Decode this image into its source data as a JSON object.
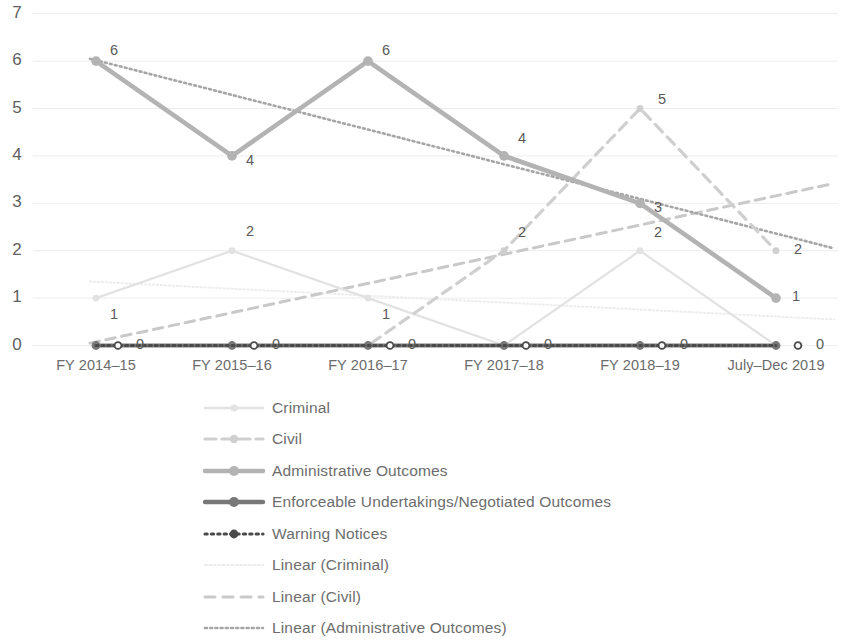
{
  "chart_data": {
    "type": "line",
    "title": "",
    "xlabel": "",
    "ylabel": "",
    "ylim": [
      0,
      7
    ],
    "yticks": [
      0,
      1,
      2,
      3,
      4,
      5,
      6,
      7
    ],
    "grid": true,
    "legend_position": "bottom",
    "categories": [
      "FY 2014–15",
      "FY 2015–16",
      "FY 2016–17",
      "FY 2017–18",
      "FY 2018–19",
      "July–Dec 2019"
    ],
    "series": [
      {
        "name": "Criminal",
        "values": [
          1,
          2,
          1,
          0,
          2,
          0
        ],
        "color": "#e2e2e2",
        "style": "solid",
        "width": 2.2,
        "marker": "circle",
        "labels": [
          "1",
          "2",
          "1",
          "",
          "2",
          ""
        ]
      },
      {
        "name": "Civil",
        "values": [
          0,
          0,
          0,
          2,
          5,
          2
        ],
        "color": "#cfcfcf",
        "style": "dashed",
        "width": 3.2,
        "marker": "circle",
        "labels": [
          "",
          "",
          "",
          "2",
          "5",
          "2"
        ]
      },
      {
        "name": "Administrative Outcomes",
        "values": [
          6,
          4,
          6,
          4,
          3,
          1
        ],
        "color": "#b3b3b3",
        "style": "solid",
        "width": 4.6,
        "marker": "circle",
        "labels": [
          "6",
          "4",
          "6",
          "4",
          "3",
          "1"
        ]
      },
      {
        "name": "Enforceable Undertakings/Negotiated Outcomes",
        "values": [
          0,
          0,
          0,
          0,
          0,
          0
        ],
        "color": "#787878",
        "style": "solid",
        "width": 4.2,
        "marker": "circle",
        "labels": [
          "",
          "",
          "",
          "",
          "",
          "0"
        ]
      },
      {
        "name": "Warning Notices",
        "values": [
          0,
          0,
          0,
          0,
          0,
          0
        ],
        "color": "#4a4a4a",
        "style": "dotted",
        "width": 3.0,
        "marker": "circle-open",
        "labels": [
          "",
          "",
          "",
          "",
          "",
          ""
        ]
      }
    ],
    "trendlines": [
      {
        "name": "Linear (Criminal)",
        "color": "#ededed",
        "style": "dotted",
        "width": 2.0,
        "start_value": 1.35,
        "end_value": 0.55
      },
      {
        "name": "Linear (Civil)",
        "color": "#c9c9c9",
        "style": "dashed",
        "width": 3.0,
        "start_value": 0.05,
        "end_value": 3.42
      },
      {
        "name": "Linear (Administrative Outcomes)",
        "color": "#a6a6a6",
        "style": "dotted",
        "width": 2.6,
        "start_value": 6.05,
        "end_value": 2.05
      }
    ],
    "zero_line_labels": [
      "0",
      "0",
      "0",
      "0",
      "0",
      "0"
    ]
  },
  "legend": {
    "items": [
      {
        "label": "Criminal",
        "swatch": "criminal"
      },
      {
        "label": "Civil",
        "swatch": "civil"
      },
      {
        "label": "Administrative Outcomes",
        "swatch": "administrative-outcomes"
      },
      {
        "label": "Enforceable Undertakings/Negotiated Outcomes",
        "swatch": "enforceable-undertakings"
      },
      {
        "label": "Warning Notices",
        "swatch": "warning-notices"
      },
      {
        "label": "Linear (Criminal)",
        "swatch": "linear-criminal"
      },
      {
        "label": "Linear (Civil)",
        "swatch": "linear-civil"
      },
      {
        "label": "Linear (Administrative Outcomes)",
        "swatch": "linear-administrative-outcomes"
      }
    ]
  }
}
